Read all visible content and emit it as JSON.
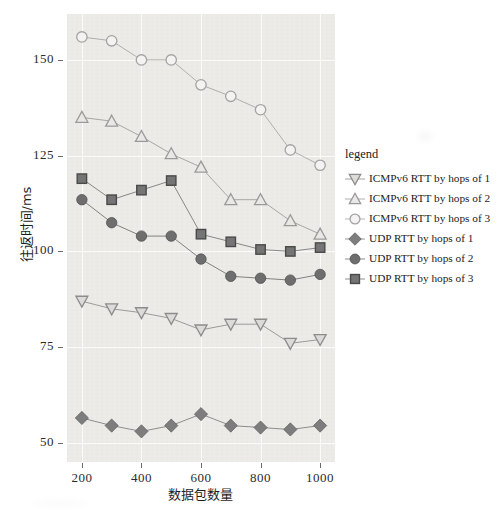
{
  "chart_data": {
    "type": "line",
    "title": "",
    "xlabel": "数据包数量",
    "ylabel": "往返时间/ms",
    "x": [
      200,
      300,
      400,
      500,
      600,
      700,
      800,
      900,
      1000
    ],
    "xlim": [
      150,
      1050
    ],
    "ylim": [
      45,
      162
    ],
    "xticks": [
      200,
      400,
      600,
      800,
      1000
    ],
    "yticks": [
      50,
      75,
      100,
      125,
      150
    ],
    "grid": true,
    "legend_position": "right",
    "legend_title": "legend",
    "series": [
      {
        "name": "ICMPv6 RTT by hops of 1",
        "marker": "triangle-down",
        "filled": false,
        "color": "#8c8c8c",
        "values": [
          87,
          85,
          84,
          82.5,
          79.5,
          81,
          81,
          76,
          77
        ]
      },
      {
        "name": "ICMPv6 RTT by hops of 2",
        "marker": "triangle-up",
        "filled": false,
        "color": "#9a9a9a",
        "values": [
          135,
          134,
          130,
          125.5,
          122,
          113.5,
          113.5,
          108,
          104.5
        ]
      },
      {
        "name": "ICMPv6 RTT by hops of 3",
        "marker": "circle-open",
        "filled": false,
        "color": "#a3a3a3",
        "values": [
          156,
          155,
          150,
          150,
          143.5,
          140.5,
          137,
          126.5,
          122.5
        ]
      },
      {
        "name": "UDP RTT by hops of 1",
        "marker": "diamond",
        "filled": true,
        "color": "#7d7d7d",
        "values": [
          56.5,
          54.5,
          53,
          54.5,
          57.5,
          54.5,
          54,
          53.5,
          54.5
        ]
      },
      {
        "name": "UDP RTT by hops of 2",
        "marker": "circle-filled",
        "filled": true,
        "color": "#6e6e6e",
        "values": [
          113.5,
          107.5,
          104,
          104,
          98,
          93.5,
          93,
          92.5,
          94
        ]
      },
      {
        "name": "UDP RTT by hops of 3",
        "marker": "square",
        "filled": true,
        "color": "#757575",
        "values": [
          119,
          113.5,
          116,
          118.5,
          104.5,
          102.5,
          100.5,
          100,
          101
        ]
      }
    ]
  },
  "axes": {
    "y_tick_labels": [
      "150",
      "125",
      "100",
      "75",
      "50"
    ],
    "x_tick_labels": [
      "200",
      "400",
      "600",
      "800",
      "1000"
    ],
    "y_axis_title": "往返时间/ms",
    "x_axis_title": "数据包数量"
  },
  "legend": {
    "title": "legend",
    "items": [
      {
        "label": "ICMPv6 RTT by hops of 1",
        "marker": "triangle-down"
      },
      {
        "label": "ICMPv6 RTT by hops of 2",
        "marker": "triangle-up"
      },
      {
        "label": "ICMPv6 RTT by hops of 3",
        "marker": "circle-open"
      },
      {
        "label": "UDP RTT by hops of 1",
        "marker": "diamond"
      },
      {
        "label": "UDP RTT by hops of 2",
        "marker": "circle-filled"
      },
      {
        "label": "UDP RTT by hops of 3",
        "marker": "square"
      }
    ]
  },
  "colors": {
    "plot_background": "#eeedea",
    "grid": "#fbfbfa",
    "axis_text": "#2b2b2b",
    "page_background": "#ffffff"
  }
}
